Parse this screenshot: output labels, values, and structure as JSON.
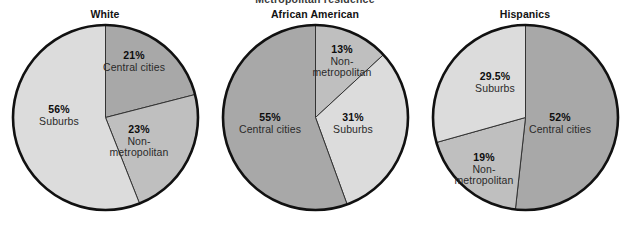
{
  "figure": {
    "partial_top_title": "Metropolitan residence",
    "background_color": "#ffffff"
  },
  "palette": {
    "central_cities": "#a8a8a8",
    "suburbs": "#dcdcdc",
    "non_metropolitan": "#bfbfbf",
    "outline": "#111111",
    "slice_divider": "#333333",
    "title_color": "#121212"
  },
  "chart_data": {
    "type": "pie",
    "title": "",
    "charts": [
      {
        "title": "White",
        "categories": [
          "Central cities",
          "Non-metropolitan",
          "Suburbs"
        ],
        "values": [
          21,
          23,
          56
        ],
        "labels": [
          "21%",
          "23%",
          "56%"
        ],
        "colors": [
          "#a8a8a8",
          "#bfbfbf",
          "#dcdcdc"
        ],
        "start_angle_deg": 0,
        "direction": "clockwise",
        "slices": [
          {
            "name": "Central cities",
            "pct_label": "21%",
            "value": 21,
            "color": "#a8a8a8",
            "label_lines": [
              "Central cities"
            ],
            "label_x": 134,
            "label_y": 50
          },
          {
            "name": "Non-metropolitan",
            "pct_label": "23%",
            "value": 23,
            "color": "#bfbfbf",
            "label_lines": [
              "Non-",
              "metropolitan"
            ],
            "label_x": 139,
            "label_y": 124
          },
          {
            "name": "Suburbs",
            "pct_label": "56%",
            "value": 56,
            "color": "#dcdcdc",
            "label_lines": [
              "Suburbs"
            ],
            "label_x": 59,
            "label_y": 104
          }
        ]
      },
      {
        "title": "African American",
        "categories": [
          "Non-metropolitan",
          "Suburbs",
          "Central cities"
        ],
        "values": [
          13,
          31,
          55
        ],
        "labels": [
          "13%",
          "31%",
          "55%"
        ],
        "colors": [
          "#bfbfbf",
          "#dcdcdc",
          "#a8a8a8"
        ],
        "start_angle_deg": 0,
        "direction": "clockwise",
        "slices": [
          {
            "name": "Non-metropolitan",
            "pct_label": "13%",
            "value": 13,
            "color": "#bfbfbf",
            "label_lines": [
              "Non-",
              "metropolitan"
            ],
            "label_x": 342,
            "label_y": 44
          },
          {
            "name": "Suburbs",
            "pct_label": "31%",
            "value": 31,
            "color": "#dcdcdc",
            "label_lines": [
              "Suburbs"
            ],
            "label_x": 353,
            "label_y": 112
          },
          {
            "name": "Central cities",
            "pct_label": "55%",
            "value": 55,
            "color": "#a8a8a8",
            "label_lines": [
              "Central cities"
            ],
            "label_x": 270,
            "label_y": 112
          }
        ]
      },
      {
        "title": "Hispanics",
        "categories": [
          "Central cities",
          "Non-metropolitan",
          "Suburbs"
        ],
        "values": [
          52,
          19,
          29.5
        ],
        "labels": [
          "52%",
          "19%",
          "29.5%"
        ],
        "colors": [
          "#a8a8a8",
          "#bfbfbf",
          "#dcdcdc"
        ],
        "start_angle_deg": 0,
        "direction": "clockwise",
        "slices": [
          {
            "name": "Central cities",
            "pct_label": "52%",
            "value": 52,
            "color": "#a8a8a8",
            "label_lines": [
              "Central cities"
            ],
            "label_x": 560,
            "label_y": 112
          },
          {
            "name": "Non-metropolitan",
            "pct_label": "19%",
            "value": 19,
            "color": "#bfbfbf",
            "label_lines": [
              "Non-",
              "metropolitan"
            ],
            "label_x": 484,
            "label_y": 152
          },
          {
            "name": "Suburbs",
            "pct_label": "29.5%",
            "value": 29.5,
            "color": "#dcdcdc",
            "label_lines": [
              "Suburbs"
            ],
            "label_x": 495,
            "label_y": 71
          }
        ]
      }
    ],
    "xlabel": "",
    "ylabel": "",
    "legend": "none",
    "grid": false
  }
}
